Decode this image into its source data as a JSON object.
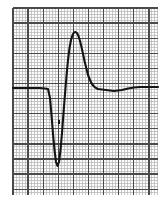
{
  "figure": {
    "kind": "ecg-strip",
    "background_color": "#ffffff"
  },
  "grid": {
    "x0": 13,
    "y0": 8,
    "x1": 158,
    "y1": 195,
    "minor_spacing_px": 3.02,
    "major_every": 5,
    "minor_color": "#b4b4b4",
    "major_color": "#4a4a4a",
    "paper_color": "#fbfbfb",
    "grid_on": true
  },
  "trace": {
    "color": "#141414",
    "width_px": 2.1,
    "baseline_y_px": 88
  },
  "annotations": {
    "notch_x_px": 59,
    "notch_y_px": 122,
    "notch_color": "#141414"
  },
  "chart_data": {
    "type": "line",
    "subtitle": "",
    "xlabel": "",
    "ylabel": "",
    "grid": true,
    "legend": "none",
    "xlim": [
      13,
      158
    ],
    "ylim": [
      195,
      8
    ],
    "axis_note": "pixel coordinates; y inverted (smaller y = higher amplitude)",
    "baseline_px": 88,
    "features": [
      {
        "name": "isoelectric-baseline-left",
        "x_px": 13,
        "y_px": 88
      },
      {
        "name": "q-wave-onset",
        "x_px": 48,
        "y_px": 88
      },
      {
        "name": "q-wave-trough",
        "x_px": 55,
        "y_px": 165
      },
      {
        "name": "r-wave-upstroke-midpoint",
        "x_px": 64,
        "y_px": 95
      },
      {
        "name": "r-wave-apex",
        "x_px": 75,
        "y_px": 32
      },
      {
        "name": "r-wave-downstroke-midpoint",
        "x_px": 86,
        "y_px": 60
      },
      {
        "name": "s-t-junction",
        "x_px": 98,
        "y_px": 89
      },
      {
        "name": "s-t-shallow-dip",
        "x_px": 113,
        "y_px": 91
      },
      {
        "name": "isoelectric-baseline-right",
        "x_px": 158,
        "y_px": 87
      }
    ],
    "series": [
      {
        "name": "ecg-trace",
        "x": [
          13,
          20,
          27,
          34,
          40,
          45,
          48,
          50,
          51.5,
          53,
          54.5,
          56,
          57.5,
          59,
          60.5,
          62,
          63.5,
          65,
          66.5,
          68,
          69.5,
          71,
          72.5,
          74,
          75.5,
          77,
          78.5,
          80,
          81.5,
          83,
          84.5,
          86,
          88,
          90,
          92,
          94,
          96,
          98,
          102,
          106,
          110,
          114,
          118,
          122,
          128,
          134,
          140,
          146,
          152,
          158
        ],
        "y": [
          88,
          88,
          88,
          88,
          88,
          88.5,
          89,
          98,
          115,
          134,
          150,
          162,
          166,
          162,
          150,
          133,
          113,
          94,
          76,
          60,
          48,
          40,
          35,
          32.5,
          32,
          33,
          36,
          41,
          47,
          54,
          61,
          67,
          75,
          80,
          84,
          86.5,
          88,
          89,
          89.5,
          90,
          90.5,
          91,
          90.5,
          90,
          88.5,
          87.5,
          87,
          87,
          87,
          87
        ]
      }
    ]
  }
}
